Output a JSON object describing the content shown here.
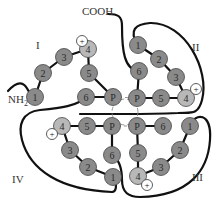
{
  "labels": {
    "cooh": "COOH",
    "nh2": "NH",
    "nh2_sub": "2",
    "domain_I": "I",
    "domain_II": "II",
    "domain_III": "III",
    "domain_IV": "IV"
  },
  "colors": {
    "node_dark": "#8a8a8a",
    "node_light": "#b8b8b8",
    "line": "#111111",
    "dashed": "#888888"
  },
  "nodes": [
    {
      "id": "I-1",
      "label": "1",
      "x": 35,
      "y": 97,
      "shade": "dark"
    },
    {
      "id": "I-2",
      "label": "2",
      "x": 43,
      "y": 73,
      "shade": "dark"
    },
    {
      "id": "I-3",
      "label": "3",
      "x": 64,
      "y": 57,
      "shade": "dark"
    },
    {
      "id": "I-4",
      "label": "4",
      "x": 88,
      "y": 49,
      "shade": "light",
      "charge": "+"
    },
    {
      "id": "I-5",
      "label": "5",
      "x": 89,
      "y": 73,
      "shade": "dark"
    },
    {
      "id": "I-P",
      "label": "P",
      "x": 113,
      "y": 97,
      "shade": "dark"
    },
    {
      "id": "I-6",
      "label": "6",
      "x": 86,
      "y": 97,
      "shade": "dark"
    },
    {
      "id": "II-1",
      "label": "1",
      "x": 138,
      "y": 45,
      "shade": "dark"
    },
    {
      "id": "II-2",
      "label": "2",
      "x": 159,
      "y": 59,
      "shade": "dark"
    },
    {
      "id": "II-3",
      "label": "3",
      "x": 176,
      "y": 77,
      "shade": "dark"
    },
    {
      "id": "II-4",
      "label": "4",
      "x": 186,
      "y": 98,
      "shade": "light",
      "charge": "+"
    },
    {
      "id": "II-5",
      "label": "5",
      "x": 161,
      "y": 98,
      "shade": "dark"
    },
    {
      "id": "II-P",
      "label": "P",
      "x": 137,
      "y": 98,
      "shade": "dark"
    },
    {
      "id": "II-6",
      "label": "6",
      "x": 139,
      "y": 71,
      "shade": "dark"
    },
    {
      "id": "III-1",
      "label": "1",
      "x": 190,
      "y": 126,
      "shade": "dark"
    },
    {
      "id": "III-2",
      "label": "2",
      "x": 180,
      "y": 150,
      "shade": "dark"
    },
    {
      "id": "III-3",
      "label": "3",
      "x": 161,
      "y": 167,
      "shade": "dark"
    },
    {
      "id": "III-4",
      "label": "4",
      "x": 138,
      "y": 176,
      "shade": "light",
      "charge": "+"
    },
    {
      "id": "III-5",
      "label": "5",
      "x": 138,
      "y": 153,
      "shade": "dark"
    },
    {
      "id": "III-P",
      "label": "P",
      "x": 137,
      "y": 126,
      "shade": "dark"
    },
    {
      "id": "III-6",
      "label": "6",
      "x": 163,
      "y": 126,
      "shade": "dark"
    },
    {
      "id": "IV-1",
      "label": "1",
      "x": 113,
      "y": 177,
      "shade": "dark"
    },
    {
      "id": "IV-2",
      "label": "2",
      "x": 88,
      "y": 167,
      "shade": "dark"
    },
    {
      "id": "IV-3",
      "label": "3",
      "x": 70,
      "y": 150,
      "shade": "dark"
    },
    {
      "id": "IV-4",
      "label": "4",
      "x": 62,
      "y": 126,
      "shade": "light",
      "charge": "+"
    },
    {
      "id": "IV-5",
      "label": "5",
      "x": 87,
      "y": 126,
      "shade": "dark"
    },
    {
      "id": "IV-P",
      "label": "P",
      "x": 112,
      "y": 126,
      "shade": "dark"
    },
    {
      "id": "IV-6",
      "label": "6",
      "x": 112,
      "y": 155,
      "shade": "dark"
    }
  ]
}
